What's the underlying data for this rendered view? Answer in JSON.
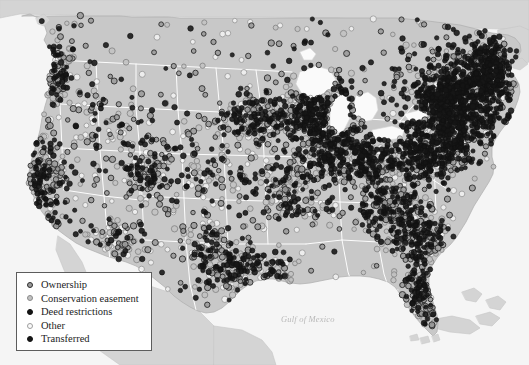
{
  "figure": {
    "type": "map",
    "region": "Contiguous United States",
    "background_color": "#ffffff",
    "land_color": "#c8c8c8",
    "neighbor_land_color": "#d4d4d4",
    "water_color": "#f5f5f5",
    "lake_color": "#fafafa",
    "border_color": "#ffffff",
    "coast_line_color": "#aeaeae"
  },
  "labels": {
    "gulf_of_mexico": "Gulf of Mexico",
    "caption": ""
  },
  "legend": {
    "title": "",
    "border_color": "#5d5d5d",
    "background_color": "#ffffff",
    "items": [
      {
        "label": "Ownership",
        "marker": "gray-filled-dark-ring",
        "fill": "#9a9a9a",
        "stroke": "#2e2e2e"
      },
      {
        "label": "Conservation easement",
        "marker": "light-gray-ring",
        "fill": "#c2c2c2",
        "stroke": "#8a8a8a"
      },
      {
        "label": "Deed restrictions",
        "marker": "solid-black-dot",
        "fill": "#141414",
        "stroke": "#111111"
      },
      {
        "label": "Other",
        "marker": "open-circle",
        "fill": "#fbfbfb",
        "stroke": "#9e9e9e"
      },
      {
        "label": "Transferred",
        "marker": "solid-black-dot",
        "fill": "#171717",
        "stroke": "#131313"
      }
    ]
  },
  "chart_data": {
    "type": "scatter",
    "title": "",
    "xlabel": "",
    "ylabel": "",
    "projection": "albers-usa-approx",
    "categories": [
      "Ownership",
      "Conservation easement",
      "Deed restrictions",
      "Other",
      "Transferred"
    ],
    "category_counts": [
      1180,
      760,
      1240,
      520,
      410
    ],
    "total_points": 4110,
    "density_note": "Highest concentration in the Northeast corridor and Great Lakes; moderate in Appalachia, Florida, Pacific Coast; sparse in the Great Plains and Intermountain West.",
    "density_regions": [
      {
        "name": "Northeast corridor",
        "cx": 455,
        "cy": 105,
        "rx": 48,
        "ry": 48,
        "weight": 820,
        "style_mix": [
          0.14,
          0.1,
          0.46,
          0.06,
          0.24
        ]
      },
      {
        "name": "New England",
        "cx": 487,
        "cy": 72,
        "rx": 28,
        "ry": 34,
        "weight": 340,
        "style_mix": [
          0.14,
          0.1,
          0.46,
          0.06,
          0.24
        ]
      },
      {
        "name": "Mid-Atlantic / Chesapeake",
        "cx": 430,
        "cy": 152,
        "rx": 38,
        "ry": 30,
        "weight": 300,
        "style_mix": [
          0.2,
          0.16,
          0.38,
          0.08,
          0.18
        ]
      },
      {
        "name": "Great Lakes / Michigan-Wisconsin",
        "cx": 318,
        "cy": 108,
        "rx": 42,
        "ry": 34,
        "weight": 290,
        "style_mix": [
          0.22,
          0.16,
          0.36,
          0.1,
          0.16
        ]
      },
      {
        "name": "Chicago / Illinois-Indiana",
        "cx": 330,
        "cy": 148,
        "rx": 34,
        "ry": 28,
        "weight": 210,
        "style_mix": [
          0.24,
          0.18,
          0.32,
          0.1,
          0.16
        ]
      },
      {
        "name": "Ohio Valley",
        "cx": 370,
        "cy": 160,
        "rx": 34,
        "ry": 26,
        "weight": 200,
        "style_mix": [
          0.24,
          0.18,
          0.32,
          0.1,
          0.16
        ]
      },
      {
        "name": "Southern Appalachia",
        "cx": 390,
        "cy": 205,
        "rx": 36,
        "ry": 32,
        "weight": 230,
        "style_mix": [
          0.26,
          0.2,
          0.3,
          0.1,
          0.14
        ]
      },
      {
        "name": "Southeast Atlantic",
        "cx": 420,
        "cy": 235,
        "rx": 32,
        "ry": 30,
        "weight": 180,
        "style_mix": [
          0.28,
          0.22,
          0.26,
          0.12,
          0.12
        ]
      },
      {
        "name": "Florida peninsula",
        "cx": 425,
        "cy": 290,
        "rx": 20,
        "ry": 38,
        "weight": 165,
        "style_mix": [
          0.28,
          0.24,
          0.24,
          0.14,
          0.1
        ]
      },
      {
        "name": "Upper Midwest / Minnesota-Iowa",
        "cx": 258,
        "cy": 120,
        "rx": 38,
        "ry": 32,
        "weight": 180,
        "style_mix": [
          0.26,
          0.2,
          0.28,
          0.12,
          0.14
        ]
      },
      {
        "name": "Missouri / Mid-South",
        "cx": 295,
        "cy": 190,
        "rx": 40,
        "ry": 34,
        "weight": 160,
        "style_mix": [
          0.26,
          0.2,
          0.28,
          0.12,
          0.14
        ]
      },
      {
        "name": "Gulf Coast Texas-Louisiana",
        "cx": 245,
        "cy": 272,
        "rx": 48,
        "ry": 24,
        "weight": 150,
        "style_mix": [
          0.28,
          0.22,
          0.26,
          0.12,
          0.12
        ]
      },
      {
        "name": "Central Texas",
        "cx": 215,
        "cy": 255,
        "rx": 34,
        "ry": 30,
        "weight": 110,
        "style_mix": [
          0.3,
          0.22,
          0.24,
          0.14,
          0.1
        ]
      },
      {
        "name": "Colorado Front Range",
        "cx": 148,
        "cy": 175,
        "rx": 22,
        "ry": 30,
        "weight": 95,
        "style_mix": [
          0.3,
          0.24,
          0.22,
          0.14,
          0.1
        ]
      },
      {
        "name": "Pacific Northwest",
        "cx": 48,
        "cy": 72,
        "rx": 26,
        "ry": 32,
        "weight": 120,
        "style_mix": [
          0.28,
          0.24,
          0.24,
          0.14,
          0.1
        ]
      },
      {
        "name": "California coast",
        "cx": 40,
        "cy": 185,
        "rx": 26,
        "ry": 48,
        "weight": 175,
        "style_mix": [
          0.28,
          0.24,
          0.24,
          0.14,
          0.1
        ]
      },
      {
        "name": "Southwest / Arizona-New Mexico",
        "cx": 120,
        "cy": 240,
        "rx": 34,
        "ry": 28,
        "weight": 80,
        "style_mix": [
          0.3,
          0.24,
          0.22,
          0.14,
          0.1
        ]
      },
      {
        "name": "Great Plains scatter",
        "cx": 205,
        "cy": 175,
        "rx": 60,
        "ry": 58,
        "weight": 120,
        "style_mix": [
          0.32,
          0.24,
          0.2,
          0.16,
          0.08
        ]
      },
      {
        "name": "Intermountain West scatter",
        "cx": 105,
        "cy": 135,
        "rx": 52,
        "ry": 58,
        "weight": 105,
        "style_mix": [
          0.32,
          0.24,
          0.2,
          0.16,
          0.08
        ]
      }
    ]
  }
}
